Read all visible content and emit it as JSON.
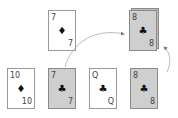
{
  "diagram": {
    "top_card": {
      "rank": "7",
      "suit": "♦",
      "suit_name": "diamond",
      "face": "white"
    },
    "deck_card": {
      "rank": "8",
      "suit": "♣",
      "suit_name": "club",
      "face": "gray"
    },
    "bottom_row": [
      {
        "rank": "10",
        "suit": "♦",
        "suit_name": "diamond",
        "face": "white"
      },
      {
        "rank": "7",
        "suit": "♣",
        "suit_name": "club",
        "face": "gray"
      },
      {
        "rank": "Q",
        "suit": "♣",
        "suit_name": "club",
        "face": "white"
      },
      {
        "rank": "8",
        "suit": "♣",
        "suit_name": "club",
        "face": "gray"
      }
    ],
    "colors": {
      "card_gray": "#cfcfcf",
      "card_white": "#ffffff",
      "border": "#9a9a9a",
      "arrow": "#999999"
    }
  }
}
